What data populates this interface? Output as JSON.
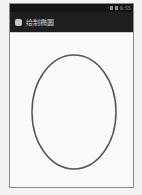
{
  "status_bar": {
    "icons": [
      "signal-icon",
      "battery-icon"
    ],
    "time": "8:55"
  },
  "title_bar": {
    "app_icon": "android-app-icon",
    "title": "绘制椭圆"
  },
  "canvas": {
    "shape": "ellipse",
    "cx": 64,
    "cy": 78,
    "rx": 42,
    "ry": 57,
    "stroke": "#555555",
    "stroke_width": 1.5,
    "fill": "none"
  },
  "colors": {
    "status_bar_bg": "#141414",
    "title_bar_bg": "#1e1e1e",
    "canvas_bg": "#fafafa"
  }
}
